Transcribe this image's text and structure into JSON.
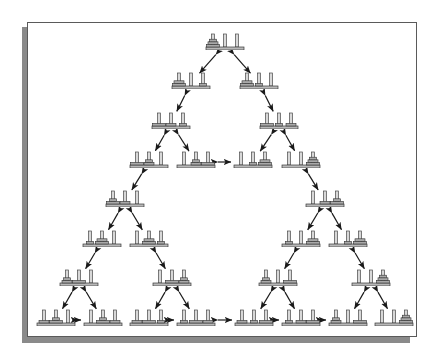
{
  "figure": {
    "type": "state-transition-graph",
    "puzzle": "Tower of Hanoi",
    "num_disks": 3,
    "num_pegs": 3,
    "num_states": 27,
    "num_edges": 39,
    "layout": "sierpinski-triangle",
    "arrow_style": "double-headed",
    "colors": {
      "background": "#ffffff",
      "frame_border": "#5a5a5a",
      "shadow": "#8a8a8a",
      "peg": "#d8d8d8",
      "peg_outline": "#4a4a4a",
      "base": "#b8b8b8",
      "base_outline": "#3a3a3a",
      "disk": "#a9a9a9",
      "disk_outline": "#303030",
      "arrow": "#1a1a1a"
    }
  },
  "legend": {
    "node_meaning": "peg configuration",
    "edge_meaning": "legal single-disk move (reversible)",
    "start_state": "all three disks on peg 1",
    "goal_state": "all three disks on peg 3"
  },
  "nodes": [
    {
      "id": "n0",
      "row": 0,
      "x": 224,
      "y": 43,
      "state": [
        [
          3,
          2,
          1
        ],
        [],
        []
      ],
      "label": "123|-|-"
    },
    {
      "id": "n1",
      "row": 1,
      "x": 190,
      "y": 82,
      "state": [
        [
          3,
          2
        ],
        [],
        [
          1
        ]
      ],
      "label": "23|-|1"
    },
    {
      "id": "n2",
      "row": 1,
      "x": 258,
      "y": 82,
      "state": [
        [
          3,
          2
        ],
        [
          1
        ],
        []
      ],
      "label": "23|1|-"
    },
    {
      "id": "n3",
      "row": 2,
      "x": 170,
      "y": 122,
      "state": [
        [
          3
        ],
        [
          2
        ],
        [
          1
        ]
      ],
      "label": "3|2|1"
    },
    {
      "id": "n4",
      "row": 2,
      "x": 278,
      "y": 122,
      "state": [
        [
          3
        ],
        [
          1
        ],
        [
          2
        ]
      ],
      "label": "3|1|2"
    },
    {
      "id": "n5",
      "row": 3,
      "x": 148,
      "y": 161,
      "state": [
        [
          3
        ],
        [
          2,
          1
        ],
        []
      ],
      "label": "3|12|-"
    },
    {
      "id": "n6",
      "row": 3,
      "x": 195,
      "y": 161,
      "state": [
        [],
        [
          2,
          1
        ],
        [
          3
        ]
      ],
      "label": "-|12|3"
    },
    {
      "id": "n7",
      "row": 3,
      "x": 252,
      "y": 161,
      "state": [
        [],
        [
          1
        ],
        [
          3,
          2
        ]
      ],
      "label": "-|1|32"
    },
    {
      "id": "n8",
      "row": 3,
      "x": 300,
      "y": 161,
      "state": [
        [],
        [],
        [
          3,
          2,
          1
        ]
      ],
      "label": "-|-|321"
    },
    {
      "id": "n9",
      "row": 4,
      "x": 124,
      "y": 200,
      "state": [
        [
          3,
          1
        ],
        [
          2
        ],
        []
      ],
      "label": "31|2|-"
    },
    {
      "id": "n10",
      "row": 4,
      "x": 324,
      "y": 200,
      "state": [
        [],
        [
          2
        ],
        [
          3,
          1
        ]
      ],
      "label": "-|2|31"
    },
    {
      "id": "n11",
      "row": 5,
      "x": 101,
      "y": 240,
      "state": [
        [
          1
        ],
        [
          3,
          2
        ],
        []
      ],
      "label": "1|32|-"
    },
    {
      "id": "n12",
      "row": 5,
      "x": 148,
      "y": 240,
      "state": [
        [],
        [
          3,
          2
        ],
        [
          1
        ]
      ],
      "label": "-|32|1"
    },
    {
      "id": "n13",
      "row": 5,
      "x": 300,
      "y": 240,
      "state": [
        [
          1
        ],
        [],
        [
          3,
          2
        ]
      ],
      "label": "1|-|32"
    },
    {
      "id": "n14",
      "row": 5,
      "x": 347,
      "y": 240,
      "state": [
        [],
        [
          1
        ],
        [
          3,
          2
        ]
      ],
      "label": "-|1|32"
    },
    {
      "id": "n15",
      "row": 6,
      "x": 78,
      "y": 279,
      "state": [
        [
          2,
          1
        ],
        [
          3
        ],
        []
      ],
      "label": "21|3|-"
    },
    {
      "id": "n16",
      "row": 6,
      "x": 171,
      "y": 279,
      "state": [
        [],
        [
          3
        ],
        [
          2,
          1
        ]
      ],
      "label": "-|3|21"
    },
    {
      "id": "n17",
      "row": 6,
      "x": 277,
      "y": 279,
      "state": [
        [
          2,
          1
        ],
        [],
        [
          3
        ]
      ],
      "label": "21|-|3"
    },
    {
      "id": "n18",
      "row": 6,
      "x": 370,
      "y": 279,
      "state": [
        [],
        [],
        [
          3,
          2,
          1
        ]
      ],
      "label": "-|-|321"
    },
    {
      "id": "n19",
      "row": 7,
      "x": 55,
      "y": 319,
      "state": [
        [
          2
        ],
        [
          3,
          1
        ],
        []
      ],
      "label": "2|31|-"
    },
    {
      "id": "n20",
      "row": 7,
      "x": 102,
      "y": 319,
      "state": [
        [],
        [
          3,
          1
        ],
        [
          2
        ]
      ],
      "label": "-|31|2"
    },
    {
      "id": "n21",
      "row": 7,
      "x": 148,
      "y": 319,
      "state": [
        [
          2
        ],
        [
          3
        ],
        [
          1
        ]
      ],
      "label": "2|3|1"
    },
    {
      "id": "n22",
      "row": 7,
      "x": 195,
      "y": 319,
      "state": [
        [
          1
        ],
        [
          3
        ],
        [
          2
        ]
      ],
      "label": "1|3|2"
    },
    {
      "id": "n23",
      "row": 7,
      "x": 253,
      "y": 319,
      "state": [
        [
          2
        ],
        [
          1
        ],
        [
          3
        ]
      ],
      "label": "2|1|3"
    },
    {
      "id": "n24",
      "row": 7,
      "x": 300,
      "y": 319,
      "state": [
        [
          1
        ],
        [
          2
        ],
        [
          3
        ]
      ],
      "label": "1|2|3"
    },
    {
      "id": "n25",
      "row": 7,
      "x": 347,
      "y": 319,
      "state": [
        [
          2,
          1
        ],
        [],
        [
          3
        ]
      ],
      "label": "21|-|3"
    },
    {
      "id": "n26",
      "row": 7,
      "x": 393,
      "y": 319,
      "state": [
        [],
        [],
        [
          3,
          2,
          1
        ]
      ],
      "label": "-|-|321"
    }
  ],
  "edges": [
    {
      "from": "n0",
      "to": "n1"
    },
    {
      "from": "n0",
      "to": "n2"
    },
    {
      "from": "n1",
      "to": "n3"
    },
    {
      "from": "n2",
      "to": "n4"
    },
    {
      "from": "n3",
      "to": "n5"
    },
    {
      "from": "n3",
      "to": "n6"
    },
    {
      "from": "n4",
      "to": "n7"
    },
    {
      "from": "n4",
      "to": "n8"
    },
    {
      "from": "n6",
      "to": "n7"
    },
    {
      "from": "n5",
      "to": "n9"
    },
    {
      "from": "n8",
      "to": "n10"
    },
    {
      "from": "n9",
      "to": "n11"
    },
    {
      "from": "n9",
      "to": "n12"
    },
    {
      "from": "n10",
      "to": "n13"
    },
    {
      "from": "n10",
      "to": "n14"
    },
    {
      "from": "n11",
      "to": "n15"
    },
    {
      "from": "n12",
      "to": "n16"
    },
    {
      "from": "n13",
      "to": "n17"
    },
    {
      "from": "n14",
      "to": "n18"
    },
    {
      "from": "n15",
      "to": "n19"
    },
    {
      "from": "n15",
      "to": "n20"
    },
    {
      "from": "n16",
      "to": "n21"
    },
    {
      "from": "n16",
      "to": "n22"
    },
    {
      "from": "n17",
      "to": "n23"
    },
    {
      "from": "n17",
      "to": "n24"
    },
    {
      "from": "n18",
      "to": "n25"
    },
    {
      "from": "n18",
      "to": "n26"
    },
    {
      "from": "n19",
      "to": "n20"
    },
    {
      "from": "n20",
      "to": "n21"
    },
    {
      "from": "n21",
      "to": "n22"
    },
    {
      "from": "n22",
      "to": "n23"
    },
    {
      "from": "n23",
      "to": "n24"
    },
    {
      "from": "n24",
      "to": "n25"
    },
    {
      "from": "n25",
      "to": "n26"
    }
  ]
}
